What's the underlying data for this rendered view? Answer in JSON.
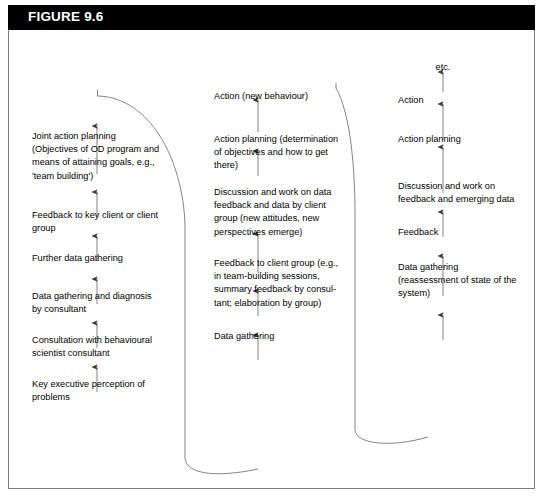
{
  "figure": {
    "label": "FIGURE 9.6",
    "header_bg": "#000000",
    "header_fg": "#ffffff",
    "border_color": "#7a7a7a",
    "line_color": "#5a5a5a",
    "text_color": "#000000"
  },
  "columns": [
    {
      "name": "phase-1",
      "nodes": [
        {
          "text": "Joint action planning\n(Objectives of OD program and\nmeans of attaining goals, e.g.,\n'team building')"
        },
        {
          "text": "Feedback to key client or client\ngroup"
        },
        {
          "text": "Further data gathering"
        },
        {
          "text": "Data gathering and diagnosis\nby consultant"
        },
        {
          "text": "Consultation with behavioural\nscientist consultant"
        },
        {
          "text": "Key executive perception of\nproblems"
        }
      ]
    },
    {
      "name": "phase-2",
      "nodes": [
        {
          "text": "Action (new behaviour)"
        },
        {
          "text": "Action planning (determination\nof objectives and how to get\nthere)"
        },
        {
          "text": "Discussion and work on data\nfeedback and data by client\ngroup (new attitudes, new\nperspectives emerge)"
        },
        {
          "text": "Feedback to client group (e.g.,\nin team-building sessions,\nsummary feedback by consul-\ntant; elaboration by group)"
        },
        {
          "text": "Data gathering"
        }
      ]
    },
    {
      "name": "phase-3",
      "nodes": [
        {
          "text": "etc."
        },
        {
          "text": "Action"
        },
        {
          "text": "Action planning"
        },
        {
          "text": "Discussion and work on\nfeedback and emerging data"
        },
        {
          "text": "Feedback"
        },
        {
          "text": "Data gathering\n(reassessment of state of the\nsystem)"
        }
      ]
    }
  ]
}
